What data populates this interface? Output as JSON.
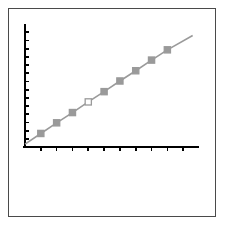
{
  "figure": {
    "background_color": "#ffffff",
    "frame_color": "#4a4a4a",
    "axis_color": "#000000"
  },
  "chart_data": {
    "type": "line",
    "title": "",
    "subtitle": "",
    "xlabel": "",
    "ylabel": "",
    "grid": false,
    "legend": null,
    "legend_position": "none",
    "line_color": "#9a9a9a",
    "marker_color": "#9a9a9a",
    "marker_shape": "square",
    "marker_open_index": 5,
    "xlim": [
      0,
      11
    ],
    "ylim": [
      0,
      15
    ],
    "xticks": [
      1,
      2,
      3,
      4,
      5,
      6,
      7,
      8,
      9,
      10
    ],
    "xtick_labels": [
      "",
      "",
      "",
      "",
      "",
      "",
      "",
      "",
      "",
      ""
    ],
    "yticks": [
      1,
      2,
      3,
      4,
      5,
      6,
      7,
      8,
      9,
      10,
      11,
      12,
      13,
      14
    ],
    "ytick_labels": [
      "",
      "",
      "",
      "",
      "",
      "",
      "",
      "",
      "",
      "",
      "",
      "",
      "",
      ""
    ],
    "series": [
      {
        "name": "series-1",
        "x": [
          0.0,
          1.0,
          2.0,
          3.0,
          4.0,
          5.0,
          6.0,
          7.0,
          8.0,
          9.0,
          10.6
        ],
        "y": [
          0.35,
          1.65,
          2.95,
          4.2,
          5.5,
          6.75,
          8.05,
          9.3,
          10.6,
          11.85,
          13.6
        ],
        "marker_points": [
          {
            "x": 1.0,
            "y": 1.65,
            "filled": true
          },
          {
            "x": 2.0,
            "y": 2.95,
            "filled": true
          },
          {
            "x": 3.0,
            "y": 4.2,
            "filled": true
          },
          {
            "x": 4.0,
            "y": 5.5,
            "filled": false
          },
          {
            "x": 5.0,
            "y": 6.75,
            "filled": true
          },
          {
            "x": 6.0,
            "y": 8.05,
            "filled": true
          },
          {
            "x": 7.0,
            "y": 9.3,
            "filled": true
          },
          {
            "x": 8.0,
            "y": 10.6,
            "filled": true
          },
          {
            "x": 9.0,
            "y": 11.85,
            "filled": true
          }
        ]
      }
    ]
  }
}
